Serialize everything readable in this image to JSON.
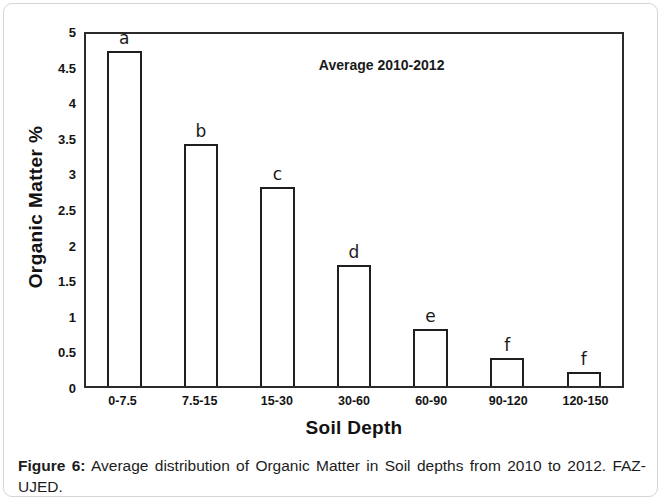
{
  "figure": {
    "caption_label": "Figure 6:",
    "caption_text": " Average distribution of Organic Matter in Soil depths from 2010 to 2012. FAZ-UJED."
  },
  "chart_data": {
    "type": "bar",
    "title": "",
    "annotation": "Average 2010-2012",
    "xlabel": "Soil Depth",
    "ylabel": "Organic Matter %",
    "categories": [
      "0-7.5",
      "7.5-15",
      "15-30",
      "30-60",
      "60-90",
      "90-120",
      "120-150"
    ],
    "values": [
      4.7,
      3.4,
      2.8,
      1.7,
      0.8,
      0.4,
      0.2
    ],
    "point_labels": [
      "a",
      "b",
      "c",
      "d",
      "e",
      "f",
      "f"
    ],
    "ylim": [
      0,
      5
    ],
    "ytick_step": 0.5,
    "yticks": [
      "5",
      "4.5",
      "4",
      "3.5",
      "3",
      "2.5",
      "2",
      "1.5",
      "1",
      "0.5",
      "0"
    ],
    "grid": false,
    "legend": "none",
    "bar_fill_color": "#ffffff",
    "bar_edge_color": "#1f1f1f"
  }
}
